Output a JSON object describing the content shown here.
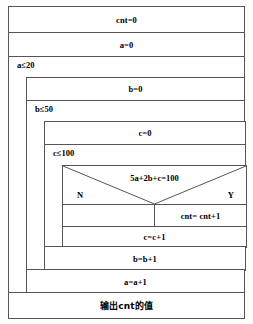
{
  "diagram": {
    "type": "nassi-shneiderman-flowchart",
    "title_text": "",
    "init": {
      "cnt_init": "cnt=0",
      "a_init": "a=0"
    },
    "outer_loop": {
      "condition": "a≤20",
      "body": {
        "b_init": "b=0",
        "middle_loop": {
          "condition": "b≤50",
          "body": {
            "c_init": "c=0",
            "inner_loop": {
              "condition": "c≤100",
              "body": {
                "decision": {
                  "condition": "5a+2b+c=100",
                  "no_label": "N",
                  "yes_label": "Y",
                  "no_action": "",
                  "yes_action": "cnt= cnt+1"
                },
                "c_increment": "c=c+1"
              }
            },
            "b_increment": "b=b+1"
          }
        },
        "a_increment": "a=a+1"
      }
    },
    "output": "输出cnt的值"
  },
  "colors": {
    "line": "#555555",
    "paper": "#fdfdfc",
    "box": "#ffffff",
    "text": "#000000"
  }
}
